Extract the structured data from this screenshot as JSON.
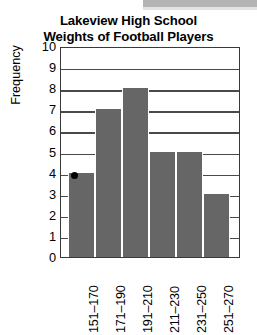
{
  "chart_data": {
    "type": "bar",
    "title": "Lakeview High School Weights of Football Players",
    "title_line1": "Lakeview High School",
    "title_line2": "Weights of Football Players",
    "xlabel": "",
    "ylabel": "Frequency",
    "categories": [
      "151–170",
      "171–190",
      "191–210",
      "211–230",
      "231–250",
      "251–270"
    ],
    "values": [
      4,
      7,
      8,
      5,
      5,
      3
    ],
    "ylim": [
      0,
      10
    ],
    "ytick_labels": [
      "10",
      "9",
      "8",
      "7",
      "6",
      "5",
      "4",
      "3",
      "2",
      "1",
      "0"
    ],
    "ytick_values": [
      10,
      9,
      8,
      7,
      6,
      5,
      4,
      3,
      2,
      1,
      0
    ],
    "grid": true,
    "legend": false,
    "bar_color": "#666666",
    "frame_color": "#3a3a3a",
    "annotations": [
      {
        "name": "point-marker",
        "category": "151–170",
        "value": 4,
        "color": "#000000"
      }
    ]
  }
}
